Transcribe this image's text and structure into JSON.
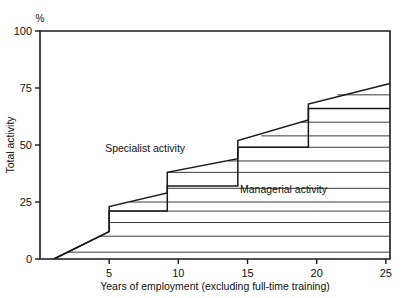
{
  "chart_data": {
    "type": "area",
    "title": "",
    "subtitle": "",
    "xlabel": "Years of employment (excluding full-time training)",
    "ylabel": "Total activity",
    "yunit": "%",
    "xlim": [
      0,
      25.3
    ],
    "ylim": [
      0,
      100
    ],
    "xticks": [
      5,
      10,
      15,
      20,
      25
    ],
    "xticklabels": [
      "5",
      "10",
      "15",
      "20",
      "25"
    ],
    "yticks": [
      0,
      25,
      50,
      75,
      100
    ],
    "yticklabels": [
      "0",
      "25",
      "50",
      "75",
      "100"
    ],
    "grid": false,
    "legend_position": "inline-annotations",
    "annotations": [
      {
        "text": "Specialist activity",
        "x": 7.6,
        "y": 47
      },
      {
        "text": "Managerial activity",
        "x": 17.6,
        "y": 29
      }
    ],
    "series": [
      {
        "name": "Total activity (upper boundary)",
        "description": "Cumulative total activity curve rising in steps at 5, 9, 14 and 19 years",
        "points": [
          {
            "x": 1.0,
            "y": 0
          },
          {
            "x": 5.0,
            "y": 12
          },
          {
            "x": 5.0,
            "y": 23
          },
          {
            "x": 9.2,
            "y": 29
          },
          {
            "x": 9.2,
            "y": 38
          },
          {
            "x": 14.3,
            "y": 44
          },
          {
            "x": 14.3,
            "y": 52
          },
          {
            "x": 19.4,
            "y": 61
          },
          {
            "x": 19.4,
            "y": 68
          },
          {
            "x": 25.3,
            "y": 77
          }
        ]
      },
      {
        "name": "Managerial activity (lower band boundary)",
        "description": "Stepped lower boundary separating managerial activity from specialist activity",
        "points": [
          {
            "x": 1.0,
            "y": 0
          },
          {
            "x": 5.0,
            "y": 12
          },
          {
            "x": 5.0,
            "y": 21
          },
          {
            "x": 9.2,
            "y": 21
          },
          {
            "x": 9.2,
            "y": 32
          },
          {
            "x": 14.3,
            "y": 32
          },
          {
            "x": 14.3,
            "y": 49
          },
          {
            "x": 19.4,
            "y": 49
          },
          {
            "x": 19.4,
            "y": 66
          },
          {
            "x": 25.3,
            "y": 66
          }
        ]
      }
    ],
    "hatch_lines": [
      {
        "y": 3,
        "x0": 2.1,
        "x1": 25.3
      },
      {
        "y": 10,
        "x0": 4.3,
        "x1": 25.3
      },
      {
        "y": 16,
        "x0": 5.0,
        "x1": 25.3
      },
      {
        "y": 21,
        "x0": 5.0,
        "x1": 25.3
      },
      {
        "y": 25,
        "x0": 6.5,
        "x1": 25.3
      },
      {
        "y": 31,
        "x0": 9.2,
        "x1": 25.3
      },
      {
        "y": 38,
        "x0": 9.2,
        "x1": 25.3
      },
      {
        "y": 43,
        "x0": 13.6,
        "x1": 25.3
      },
      {
        "y": 49,
        "x0": 14.3,
        "x1": 25.3
      },
      {
        "y": 54,
        "x0": 16.0,
        "x1": 25.3
      },
      {
        "y": 60,
        "x0": 18.8,
        "x1": 25.3
      },
      {
        "y": 66,
        "x0": 19.4,
        "x1": 25.3
      },
      {
        "y": 72,
        "x0": 21.5,
        "x1": 25.3
      }
    ]
  }
}
